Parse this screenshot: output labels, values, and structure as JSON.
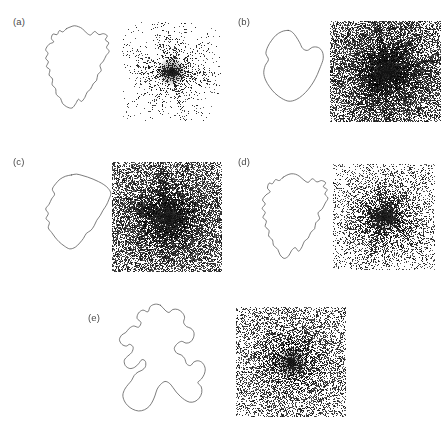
{
  "figure": {
    "width": 445,
    "height": 429,
    "background_color": "#ffffff",
    "stroke_color": "#5a5a5a",
    "label_color": "#4a4a4a"
  },
  "panels": [
    {
      "id": "a",
      "label": "(a)",
      "label_x": 13,
      "label_y": 16,
      "shape": {
        "name": "contour-a",
        "x": 40,
        "y": 24,
        "width": 76,
        "height": 88,
        "roughness": "jagged",
        "lobes": 1,
        "points": [
          [
            0.345,
            0.055
          ],
          [
            0.3,
            0.09
          ],
          [
            0.255,
            0.075
          ],
          [
            0.225,
            0.12
          ],
          [
            0.17,
            0.115
          ],
          [
            0.15,
            0.165
          ],
          [
            0.18,
            0.205
          ],
          [
            0.12,
            0.23
          ],
          [
            0.075,
            0.29
          ],
          [
            0.105,
            0.335
          ],
          [
            0.075,
            0.39
          ],
          [
            0.11,
            0.43
          ],
          [
            0.085,
            0.485
          ],
          [
            0.13,
            0.52
          ],
          [
            0.12,
            0.58
          ],
          [
            0.165,
            0.625
          ],
          [
            0.16,
            0.69
          ],
          [
            0.205,
            0.735
          ],
          [
            0.215,
            0.8
          ],
          [
            0.27,
            0.845
          ],
          [
            0.295,
            0.9
          ],
          [
            0.35,
            0.94
          ],
          [
            0.42,
            0.955
          ],
          [
            0.47,
            0.905
          ],
          [
            0.505,
            0.855
          ],
          [
            0.545,
            0.88
          ],
          [
            0.59,
            0.835
          ],
          [
            0.62,
            0.775
          ],
          [
            0.665,
            0.74
          ],
          [
            0.7,
            0.68
          ],
          [
            0.745,
            0.64
          ],
          [
            0.76,
            0.575
          ],
          [
            0.805,
            0.53
          ],
          [
            0.79,
            0.47
          ],
          [
            0.835,
            0.42
          ],
          [
            0.87,
            0.36
          ],
          [
            0.91,
            0.31
          ],
          [
            0.875,
            0.265
          ],
          [
            0.905,
            0.215
          ],
          [
            0.86,
            0.18
          ],
          [
            0.885,
            0.135
          ],
          [
            0.835,
            0.11
          ],
          [
            0.775,
            0.12
          ],
          [
            0.72,
            0.085
          ],
          [
            0.665,
            0.125
          ],
          [
            0.61,
            0.1
          ],
          [
            0.56,
            0.055
          ],
          [
            0.505,
            0.03
          ],
          [
            0.45,
            0.02
          ],
          [
            0.395,
            0.035
          ]
        ]
      },
      "noise": {
        "name": "speckle-a",
        "x": 122,
        "y": 22,
        "width": 99,
        "height": 99,
        "density": 0.16,
        "core_density": 0.92,
        "core_radius": 0.06,
        "falloff": 2.0,
        "streak_count": 70,
        "streak_strength": 0.45,
        "base_level": 0.02,
        "dot_gray": 70
      }
    },
    {
      "id": "b",
      "label": "(b)",
      "label_x": 238,
      "label_y": 16,
      "shape": {
        "name": "contour-b",
        "x": 258,
        "y": 28,
        "width": 72,
        "height": 80,
        "roughness": "smooth",
        "lobes": 1,
        "points": [
          [
            0.42,
            0.03
          ],
          [
            0.33,
            0.045
          ],
          [
            0.25,
            0.09
          ],
          [
            0.185,
            0.16
          ],
          [
            0.135,
            0.235
          ],
          [
            0.11,
            0.32
          ],
          [
            0.145,
            0.395
          ],
          [
            0.1,
            0.47
          ],
          [
            0.08,
            0.56
          ],
          [
            0.105,
            0.65
          ],
          [
            0.16,
            0.735
          ],
          [
            0.235,
            0.815
          ],
          [
            0.33,
            0.88
          ],
          [
            0.43,
            0.915
          ],
          [
            0.53,
            0.895
          ],
          [
            0.62,
            0.84
          ],
          [
            0.7,
            0.765
          ],
          [
            0.77,
            0.675
          ],
          [
            0.825,
            0.58
          ],
          [
            0.87,
            0.48
          ],
          [
            0.905,
            0.385
          ],
          [
            0.895,
            0.3
          ],
          [
            0.84,
            0.245
          ],
          [
            0.76,
            0.24
          ],
          [
            0.685,
            0.28
          ],
          [
            0.62,
            0.255
          ],
          [
            0.58,
            0.185
          ],
          [
            0.53,
            0.11
          ],
          [
            0.48,
            0.055
          ]
        ]
      },
      "noise": {
        "name": "speckle-b",
        "x": 330,
        "y": 21,
        "width": 111,
        "height": 101,
        "density": 0.62,
        "core_density": 0.97,
        "core_radius": 0.045,
        "falloff": 0.85,
        "streak_count": 150,
        "streak_strength": 0.75,
        "base_level": 0.46,
        "dot_gray": 55
      }
    },
    {
      "id": "c",
      "label": "(c)",
      "label_x": 13,
      "label_y": 156,
      "shape": {
        "name": "contour-c",
        "x": 42,
        "y": 172,
        "width": 74,
        "height": 84,
        "roughness": "medium",
        "lobes": 1,
        "points": [
          [
            0.4,
            0.035
          ],
          [
            0.32,
            0.05
          ],
          [
            0.245,
            0.085
          ],
          [
            0.185,
            0.14
          ],
          [
            0.14,
            0.205
          ],
          [
            0.17,
            0.265
          ],
          [
            0.13,
            0.32
          ],
          [
            0.095,
            0.385
          ],
          [
            0.05,
            0.44
          ],
          [
            0.085,
            0.495
          ],
          [
            0.055,
            0.555
          ],
          [
            0.1,
            0.6
          ],
          [
            0.085,
            0.665
          ],
          [
            0.13,
            0.72
          ],
          [
            0.175,
            0.775
          ],
          [
            0.23,
            0.83
          ],
          [
            0.3,
            0.88
          ],
          [
            0.375,
            0.915
          ],
          [
            0.45,
            0.895
          ],
          [
            0.51,
            0.845
          ],
          [
            0.56,
            0.79
          ],
          [
            0.6,
            0.73
          ],
          [
            0.66,
            0.695
          ],
          [
            0.705,
            0.64
          ],
          [
            0.74,
            0.575
          ],
          [
            0.785,
            0.52
          ],
          [
            0.825,
            0.455
          ],
          [
            0.87,
            0.395
          ],
          [
            0.905,
            0.325
          ],
          [
            0.93,
            0.255
          ],
          [
            0.895,
            0.195
          ],
          [
            0.835,
            0.15
          ],
          [
            0.765,
            0.115
          ],
          [
            0.69,
            0.085
          ],
          [
            0.615,
            0.06
          ],
          [
            0.54,
            0.04
          ],
          [
            0.465,
            0.025
          ]
        ]
      },
      "noise": {
        "name": "speckle-c",
        "x": 112,
        "y": 162,
        "width": 110,
        "height": 110,
        "density": 0.6,
        "core_density": 0.97,
        "core_radius": 0.05,
        "falloff": 1.0,
        "streak_count": 130,
        "streak_strength": 0.7,
        "base_level": 0.44,
        "dot_gray": 60
      }
    },
    {
      "id": "d",
      "label": "(d)",
      "label_x": 238,
      "label_y": 156,
      "shape": {
        "name": "contour-d",
        "x": 258,
        "y": 172,
        "width": 76,
        "height": 90,
        "roughness": "jagged",
        "lobes": 1,
        "points": [
          [
            0.33,
            0.06
          ],
          [
            0.28,
            0.095
          ],
          [
            0.23,
            0.085
          ],
          [
            0.19,
            0.13
          ],
          [
            0.145,
            0.125
          ],
          [
            0.125,
            0.18
          ],
          [
            0.16,
            0.22
          ],
          [
            0.105,
            0.255
          ],
          [
            0.06,
            0.31
          ],
          [
            0.095,
            0.355
          ],
          [
            0.055,
            0.405
          ],
          [
            0.095,
            0.45
          ],
          [
            0.065,
            0.505
          ],
          [
            0.11,
            0.545
          ],
          [
            0.095,
            0.605
          ],
          [
            0.145,
            0.65
          ],
          [
            0.14,
            0.71
          ],
          [
            0.19,
            0.755
          ],
          [
            0.205,
            0.815
          ],
          [
            0.26,
            0.86
          ],
          [
            0.29,
            0.92
          ],
          [
            0.345,
            0.96
          ],
          [
            0.405,
            0.93
          ],
          [
            0.44,
            0.875
          ],
          [
            0.49,
            0.84
          ],
          [
            0.535,
            0.88
          ],
          [
            0.58,
            0.83
          ],
          [
            0.61,
            0.77
          ],
          [
            0.66,
            0.735
          ],
          [
            0.695,
            0.67
          ],
          [
            0.745,
            0.63
          ],
          [
            0.76,
            0.565
          ],
          [
            0.81,
            0.52
          ],
          [
            0.79,
            0.455
          ],
          [
            0.845,
            0.41
          ],
          [
            0.885,
            0.345
          ],
          [
            0.92,
            0.29
          ],
          [
            0.88,
            0.245
          ],
          [
            0.91,
            0.195
          ],
          [
            0.86,
            0.165
          ],
          [
            0.89,
            0.12
          ],
          [
            0.835,
            0.095
          ],
          [
            0.775,
            0.11
          ],
          [
            0.715,
            0.075
          ],
          [
            0.66,
            0.115
          ],
          [
            0.605,
            0.09
          ],
          [
            0.55,
            0.05
          ],
          [
            0.495,
            0.025
          ],
          [
            0.435,
            0.02
          ],
          [
            0.38,
            0.035
          ]
        ]
      },
      "noise": {
        "name": "speckle-d",
        "x": 333,
        "y": 164,
        "width": 102,
        "height": 106,
        "density": 0.38,
        "core_density": 0.95,
        "core_radius": 0.055,
        "falloff": 1.5,
        "streak_count": 110,
        "streak_strength": 0.6,
        "base_level": 0.18,
        "dot_gray": 65
      }
    },
    {
      "id": "e",
      "label": "(e)",
      "label_x": 88,
      "label_y": 312,
      "shape": {
        "name": "contour-e",
        "x": 116,
        "y": 303,
        "width": 98,
        "height": 118,
        "roughness": "convoluted",
        "lobes": 5,
        "points": [
          [
            0.455,
            0.02
          ],
          [
            0.4,
            0.01
          ],
          [
            0.35,
            0.03
          ],
          [
            0.325,
            0.075
          ],
          [
            0.275,
            0.06
          ],
          [
            0.23,
            0.085
          ],
          [
            0.215,
            0.13
          ],
          [
            0.255,
            0.165
          ],
          [
            0.23,
            0.205
          ],
          [
            0.18,
            0.195
          ],
          [
            0.135,
            0.215
          ],
          [
            0.1,
            0.25
          ],
          [
            0.06,
            0.27
          ],
          [
            0.035,
            0.31
          ],
          [
            0.06,
            0.35
          ],
          [
            0.105,
            0.365
          ],
          [
            0.14,
            0.35
          ],
          [
            0.175,
            0.375
          ],
          [
            0.16,
            0.42
          ],
          [
            0.12,
            0.45
          ],
          [
            0.085,
            0.485
          ],
          [
            0.095,
            0.53
          ],
          [
            0.14,
            0.555
          ],
          [
            0.19,
            0.545
          ],
          [
            0.23,
            0.515
          ],
          [
            0.265,
            0.48
          ],
          [
            0.3,
            0.495
          ],
          [
            0.3,
            0.54
          ],
          [
            0.265,
            0.57
          ],
          [
            0.225,
            0.585
          ],
          [
            0.185,
            0.615
          ],
          [
            0.16,
            0.655
          ],
          [
            0.125,
            0.69
          ],
          [
            0.09,
            0.73
          ],
          [
            0.07,
            0.78
          ],
          [
            0.085,
            0.83
          ],
          [
            0.12,
            0.87
          ],
          [
            0.17,
            0.9
          ],
          [
            0.23,
            0.915
          ],
          [
            0.29,
            0.905
          ],
          [
            0.34,
            0.875
          ],
          [
            0.375,
            0.83
          ],
          [
            0.4,
            0.78
          ],
          [
            0.42,
            0.73
          ],
          [
            0.455,
            0.69
          ],
          [
            0.5,
            0.665
          ],
          [
            0.545,
            0.68
          ],
          [
            0.58,
            0.715
          ],
          [
            0.615,
            0.755
          ],
          [
            0.655,
            0.79
          ],
          [
            0.7,
            0.82
          ],
          [
            0.75,
            0.84
          ],
          [
            0.805,
            0.835
          ],
          [
            0.85,
            0.805
          ],
          [
            0.875,
            0.76
          ],
          [
            0.87,
            0.71
          ],
          [
            0.835,
            0.675
          ],
          [
            0.87,
            0.645
          ],
          [
            0.9,
            0.605
          ],
          [
            0.91,
            0.555
          ],
          [
            0.885,
            0.51
          ],
          [
            0.84,
            0.49
          ],
          [
            0.795,
            0.5
          ],
          [
            0.76,
            0.53
          ],
          [
            0.72,
            0.515
          ],
          [
            0.7,
            0.47
          ],
          [
            0.665,
            0.44
          ],
          [
            0.62,
            0.425
          ],
          [
            0.595,
            0.385
          ],
          [
            0.625,
            0.345
          ],
          [
            0.67,
            0.325
          ],
          [
            0.715,
            0.34
          ],
          [
            0.76,
            0.33
          ],
          [
            0.79,
            0.295
          ],
          [
            0.795,
            0.25
          ],
          [
            0.765,
            0.215
          ],
          [
            0.72,
            0.2
          ],
          [
            0.69,
            0.165
          ],
          [
            0.7,
            0.12
          ],
          [
            0.675,
            0.08
          ],
          [
            0.63,
            0.055
          ],
          [
            0.58,
            0.055
          ],
          [
            0.54,
            0.08
          ],
          [
            0.5,
            0.06
          ]
        ]
      },
      "noise": {
        "name": "speckle-e",
        "x": 236,
        "y": 307,
        "width": 110,
        "height": 110,
        "density": 0.48,
        "core_density": 0.96,
        "core_radius": 0.08,
        "falloff": 1.2,
        "streak_count": 40,
        "streak_strength": 0.25,
        "base_level": 0.3,
        "dot_gray": 62
      }
    }
  ]
}
